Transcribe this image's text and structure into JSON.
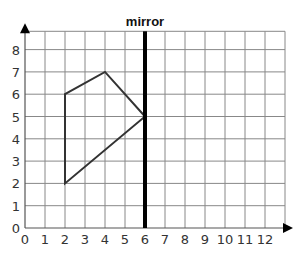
{
  "title": "mirror",
  "grid": {
    "x_min": 0,
    "x_max": 13,
    "y_min": 0,
    "y_max": 9,
    "origin_px": [
      25,
      228
    ],
    "dx_px": 20,
    "dy_px": 22.3
  },
  "x_ticks": [
    "0",
    "1",
    "2",
    "3",
    "4",
    "5",
    "6",
    "7",
    "8",
    "9",
    "10",
    "11",
    "12"
  ],
  "y_ticks": [
    "0",
    "1",
    "2",
    "3",
    "4",
    "5",
    "6",
    "7",
    "8"
  ],
  "mirror_x": 6,
  "shape_points": [
    [
      2,
      2
    ],
    [
      2,
      6
    ],
    [
      4,
      7
    ],
    [
      6,
      5
    ]
  ],
  "colors": {
    "grid": "#888888",
    "shape": "#333333",
    "mirror": "#000000"
  },
  "chart_data": {
    "type": "diagram",
    "title": "mirror",
    "polygon": [
      [
        2,
        2
      ],
      [
        2,
        6
      ],
      [
        4,
        7
      ],
      [
        6,
        5
      ]
    ],
    "mirror_line": {
      "x": 6
    },
    "xlim": [
      0,
      12
    ],
    "ylim": [
      0,
      8
    ]
  }
}
